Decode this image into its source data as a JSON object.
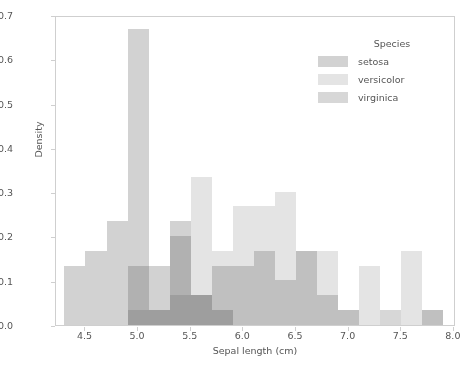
{
  "chart_data": {
    "type": "bar",
    "subtype": "overlapping-histogram",
    "title": "",
    "xlabel": "Sepal length (cm)",
    "ylabel": "Density",
    "xlim": [
      4.22,
      8.02
    ],
    "ylim": [
      0.0,
      0.7
    ],
    "grid": false,
    "bin_width": 0.2,
    "bin_edges": [
      4.3,
      4.5,
      4.7,
      4.9,
      5.1,
      5.3,
      5.5,
      5.7,
      5.9,
      6.1,
      6.3,
      6.5,
      6.7,
      6.9,
      7.1,
      7.3,
      7.5,
      7.7,
      7.9
    ],
    "x_ticks": [
      4.5,
      5.0,
      5.5,
      6.0,
      6.5,
      7.0,
      7.5,
      8.0
    ],
    "x_tick_labels": [
      "4.5",
      "5.0",
      "5.5",
      "6.0",
      "6.5",
      "7.0",
      "7.5",
      "8.0"
    ],
    "y_ticks": [
      0.0,
      0.1,
      0.2,
      0.3,
      0.4,
      0.5,
      0.6,
      0.7
    ],
    "y_tick_labels": [
      "0.0",
      "0.1",
      "0.2",
      "0.3",
      "0.4",
      "0.5",
      "0.6",
      "0.7"
    ],
    "legend": {
      "title": "Species",
      "position": "upper-right",
      "entries": [
        "setosa",
        "versicolor",
        "virginica"
      ]
    },
    "series": [
      {
        "name": "setosa",
        "color": "#d2d2d2",
        "bins": [
          {
            "x0": 4.3,
            "x1": 4.5,
            "density": 0.134
          },
          {
            "x0": 4.5,
            "x1": 4.7,
            "density": 0.167
          },
          {
            "x0": 4.7,
            "x1": 4.9,
            "density": 0.234
          },
          {
            "x0": 4.9,
            "x1": 5.1,
            "density": 0.668
          },
          {
            "x0": 5.1,
            "x1": 5.3,
            "density": 0.134
          },
          {
            "x0": 5.3,
            "x1": 5.5,
            "density": 0.234
          },
          {
            "x0": 5.5,
            "x1": 5.7,
            "density": 0.067
          },
          {
            "x0": 5.7,
            "x1": 5.9,
            "density": 0.034
          },
          {
            "x0": 5.9,
            "x1": 6.1,
            "density": 0.0
          },
          {
            "x0": 6.1,
            "x1": 6.3,
            "density": 0.0
          },
          {
            "x0": 6.3,
            "x1": 6.5,
            "density": 0.0
          },
          {
            "x0": 6.5,
            "x1": 6.7,
            "density": 0.0
          },
          {
            "x0": 6.7,
            "x1": 6.9,
            "density": 0.0
          },
          {
            "x0": 6.9,
            "x1": 7.1,
            "density": 0.0
          },
          {
            "x0": 7.1,
            "x1": 7.3,
            "density": 0.0
          },
          {
            "x0": 7.3,
            "x1": 7.5,
            "density": 0.0
          },
          {
            "x0": 7.5,
            "x1": 7.7,
            "density": 0.0
          },
          {
            "x0": 7.7,
            "x1": 7.9,
            "density": 0.0
          }
        ]
      },
      {
        "name": "versicolor",
        "color": "#e4e4e4",
        "bins": [
          {
            "x0": 4.3,
            "x1": 4.5,
            "density": 0.0
          },
          {
            "x0": 4.5,
            "x1": 4.7,
            "density": 0.0
          },
          {
            "x0": 4.7,
            "x1": 4.9,
            "density": 0.0
          },
          {
            "x0": 4.9,
            "x1": 5.1,
            "density": 0.034
          },
          {
            "x0": 5.1,
            "x1": 5.3,
            "density": 0.034
          },
          {
            "x0": 5.3,
            "x1": 5.5,
            "density": 0.067
          },
          {
            "x0": 5.5,
            "x1": 5.7,
            "density": 0.335
          },
          {
            "x0": 5.7,
            "x1": 5.9,
            "density": 0.167
          },
          {
            "x0": 5.9,
            "x1": 6.1,
            "density": 0.268
          },
          {
            "x0": 6.1,
            "x1": 6.3,
            "density": 0.268
          },
          {
            "x0": 6.3,
            "x1": 6.5,
            "density": 0.301
          },
          {
            "x0": 6.5,
            "x1": 6.7,
            "density": 0.167
          },
          {
            "x0": 6.7,
            "x1": 6.9,
            "density": 0.167
          },
          {
            "x0": 6.9,
            "x1": 7.1,
            "density": 0.034
          },
          {
            "x0": 7.1,
            "x1": 7.3,
            "density": 0.134
          },
          {
            "x0": 7.3,
            "x1": 7.5,
            "density": 0.0
          },
          {
            "x0": 7.5,
            "x1": 7.7,
            "density": 0.167
          },
          {
            "x0": 7.7,
            "x1": 7.9,
            "density": 0.034
          }
        ]
      },
      {
        "name": "virginica",
        "color": "#d7d7d7",
        "bins": [
          {
            "x0": 4.3,
            "x1": 4.5,
            "density": 0.0
          },
          {
            "x0": 4.5,
            "x1": 4.7,
            "density": 0.0
          },
          {
            "x0": 4.7,
            "x1": 4.9,
            "density": 0.0
          },
          {
            "x0": 4.9,
            "x1": 5.1,
            "density": 0.134
          },
          {
            "x0": 5.1,
            "x1": 5.3,
            "density": 0.034
          },
          {
            "x0": 5.3,
            "x1": 5.5,
            "density": 0.201
          },
          {
            "x0": 5.5,
            "x1": 5.7,
            "density": 0.067
          },
          {
            "x0": 5.7,
            "x1": 5.9,
            "density": 0.134
          },
          {
            "x0": 5.9,
            "x1": 6.1,
            "density": 0.134
          },
          {
            "x0": 6.1,
            "x1": 6.3,
            "density": 0.167
          },
          {
            "x0": 6.3,
            "x1": 6.5,
            "density": 0.101
          },
          {
            "x0": 6.5,
            "x1": 6.7,
            "density": 0.167
          },
          {
            "x0": 6.7,
            "x1": 6.9,
            "density": 0.067
          },
          {
            "x0": 6.9,
            "x1": 7.1,
            "density": 0.034
          },
          {
            "x0": 7.1,
            "x1": 7.3,
            "density": 0.0
          },
          {
            "x0": 7.3,
            "x1": 7.5,
            "density": 0.034
          },
          {
            "x0": 7.5,
            "x1": 7.7,
            "density": 0.0
          },
          {
            "x0": 7.7,
            "x1": 7.9,
            "density": 0.034
          }
        ]
      }
    ]
  }
}
